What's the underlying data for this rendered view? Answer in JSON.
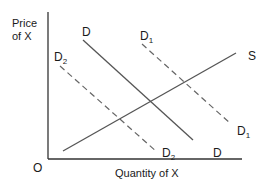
{
  "diagram": {
    "type": "supply-demand",
    "y_axis_label_line1": "Price",
    "y_axis_label_line2": "of X",
    "x_axis_label": "Quantity of X",
    "origin_label": "O",
    "curves": [
      {
        "id": "D",
        "label": "D",
        "style": "solid",
        "role": "original demand"
      },
      {
        "id": "D1",
        "label": "D",
        "subscript": "1",
        "style": "dashed",
        "role": "increased demand"
      },
      {
        "id": "D2",
        "label": "D",
        "subscript": "2",
        "style": "dashed",
        "role": "decreased demand"
      },
      {
        "id": "S",
        "label": "S",
        "style": "solid",
        "role": "supply"
      }
    ],
    "colors": {
      "axis": "#333333",
      "lines": "#555555",
      "text": "#1a1a1a",
      "background": "#ffffff"
    }
  }
}
